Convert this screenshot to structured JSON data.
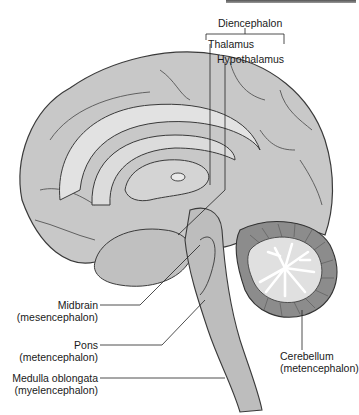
{
  "figure": {
    "type": "midsagittal brain section",
    "labels": {
      "diencephalon": "Diencephalon",
      "thalamus": "Thalamus",
      "hypothalamus": "Hypothalamus",
      "midbrain": "Midbrain",
      "midbrain_sub": "(mesencephalon)",
      "pons": "Pons",
      "pons_sub": "(metencephalon)",
      "medulla": "Medulla oblongata",
      "medulla_sub": "(myelencephalon)",
      "cerebellum": "Cerebellum",
      "cerebellum_sub": "(metencephalon)"
    },
    "colors": {
      "cortex": "#c8c8c8",
      "cortex_light": "#e2e2e2",
      "outline": "#3a3a3a",
      "cerebellum": "#8c8c8c",
      "white_matter": "#ffffff",
      "brainstem": "#bdbdbd"
    }
  }
}
